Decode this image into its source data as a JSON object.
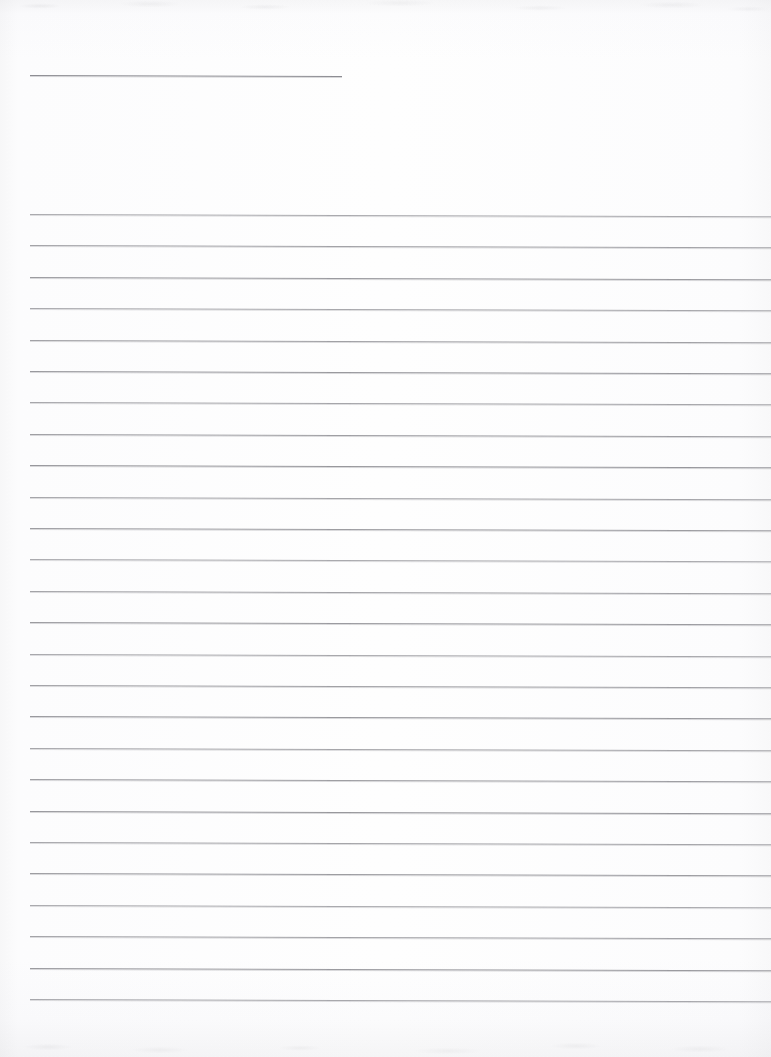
{
  "document": {
    "kind": "scanned-blank-lined-paper",
    "title": "",
    "page_text": "",
    "written_content": "",
    "background_color": "#fdfdfd",
    "rule_color": "#96969b",
    "width_px": 771,
    "height_px": 1057
  },
  "header_rule": {
    "name": "header-blank-line",
    "label": "",
    "x_start": 30,
    "x_end": 342,
    "y": 75,
    "length_px": 312,
    "skew_deg": 0.18
  },
  "body_rules": {
    "count": 26,
    "x_start": 30,
    "x_end": 771,
    "first_y": 214,
    "spacing_px": 31.4,
    "skew_deg": 0.18,
    "y_positions": [
      214,
      245,
      277,
      308,
      340,
      371,
      402,
      434,
      465,
      497,
      528,
      559,
      591,
      622,
      654,
      685,
      716,
      748,
      779,
      811,
      842,
      873,
      905,
      936,
      968,
      999
    ]
  },
  "annotations": {
    "handwriting": [],
    "margin_note": "",
    "page_number": ""
  }
}
